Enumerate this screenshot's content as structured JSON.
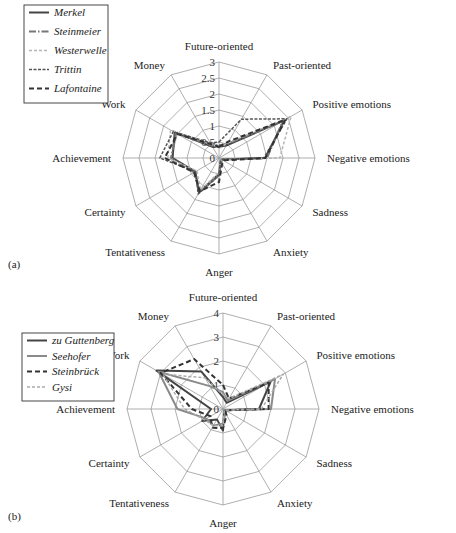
{
  "axes": [
    "Future-oriented",
    "Past-oriented",
    "Positive emotions",
    "Negative emotions",
    "Sadness",
    "Anxiety",
    "Anger",
    "Tentativeness",
    "Certainty",
    "Achievement",
    "Work",
    "Money"
  ],
  "chart_data": [
    {
      "type": "radar",
      "panel_label": "(a)",
      "title": "",
      "categories": [
        "Future-oriented",
        "Past-oriented",
        "Positive emotions",
        "Negative emotions",
        "Sadness",
        "Anxiety",
        "Anger",
        "Tentativeness",
        "Certainty",
        "Achievement",
        "Work",
        "Money"
      ],
      "rlim": [
        0,
        3
      ],
      "ticks": [
        "0",
        "0.5",
        "1",
        "1.5",
        "2",
        "2.5",
        "3"
      ],
      "tick_values": [
        0,
        0.5,
        1,
        1.5,
        2,
        2.5,
        3
      ],
      "legend_position": "upper-left",
      "series": [
        {
          "name": "Merkel",
          "style": "solid",
          "color": "#444444",
          "width": 2,
          "values": [
            0.35,
            0.45,
            2.35,
            1.45,
            0.1,
            0.1,
            0.5,
            1.25,
            0.85,
            1.45,
            1.6,
            0.4
          ]
        },
        {
          "name": "Steinmeier",
          "style": "dashdot",
          "color": "#777777",
          "width": 2,
          "values": [
            0.4,
            0.5,
            2.3,
            1.5,
            0.1,
            0.15,
            0.55,
            1.2,
            0.9,
            1.5,
            1.55,
            0.45
          ]
        },
        {
          "name": "Westerwelle",
          "style": "dashed-light",
          "color": "#b5b5b5",
          "width": 1.5,
          "values": [
            0.3,
            0.55,
            2.6,
            1.9,
            0.1,
            0.1,
            0.45,
            1.15,
            0.8,
            1.6,
            1.75,
            0.5
          ]
        },
        {
          "name": "Trittin",
          "style": "dotted-dash",
          "color": "#555555",
          "width": 1.5,
          "values": [
            0.5,
            1.4,
            2.45,
            1.4,
            0.1,
            0.1,
            0.55,
            1.3,
            0.85,
            1.85,
            1.65,
            0.55
          ]
        },
        {
          "name": "Lafontaine",
          "style": "long-dash",
          "color": "#333333",
          "width": 2,
          "values": [
            0.35,
            0.6,
            2.4,
            1.45,
            0.15,
            0.2,
            0.75,
            1.2,
            0.9,
            1.7,
            1.5,
            0.5
          ]
        }
      ]
    },
    {
      "type": "radar",
      "panel_label": "(b)",
      "title": "",
      "categories": [
        "Future-oriented",
        "Past-oriented",
        "Positive emotions",
        "Negative emotions",
        "Sadness",
        "Anxiety",
        "Anger",
        "Tentativeness",
        "Certainty",
        "Achievement",
        "Work",
        "Money"
      ],
      "rlim": [
        0,
        4
      ],
      "ticks": [
        "0",
        "1",
        "2",
        "3",
        "4"
      ],
      "tick_values": [
        0,
        1,
        2,
        3,
        4
      ],
      "legend_position": "upper-left",
      "series": [
        {
          "name": "zu Guttenberg",
          "style": "solid",
          "color": "#444444",
          "width": 2,
          "values": [
            0.5,
            0.3,
            2.3,
            1.5,
            0.1,
            0.1,
            0.9,
            0.5,
            1.0,
            0.5,
            3.2,
            1.8
          ]
        },
        {
          "name": "Seehofer",
          "style": "solid-light",
          "color": "#8a8a8a",
          "width": 2,
          "values": [
            0.7,
            0.4,
            2.5,
            2.0,
            0.1,
            0.2,
            0.6,
            0.8,
            0.8,
            1.9,
            3.1,
            1.1
          ]
        },
        {
          "name": "Steinbrück",
          "style": "long-dash",
          "color": "#333333",
          "width": 2,
          "values": [
            1.0,
            0.5,
            2.2,
            1.9,
            0.1,
            0.3,
            0.8,
            0.9,
            0.6,
            1.3,
            3.0,
            2.4
          ]
        },
        {
          "name": "Gysi",
          "style": "dashed-light",
          "color": "#aaaaaa",
          "width": 1.5,
          "values": [
            0.6,
            0.5,
            2.9,
            1.6,
            0.1,
            0.1,
            0.7,
            0.8,
            0.9,
            1.6,
            2.9,
            1.5
          ]
        }
      ]
    }
  ],
  "legend_a": [
    "Merkel",
    "Steinmeier",
    "Westerwelle",
    "Trittin",
    "Lafontaine"
  ],
  "legend_b": [
    "zu Guttenberg",
    "Seehofer",
    "Steinbrück",
    "Gysi"
  ],
  "panel_a": "(a)",
  "panel_b": "(b)"
}
